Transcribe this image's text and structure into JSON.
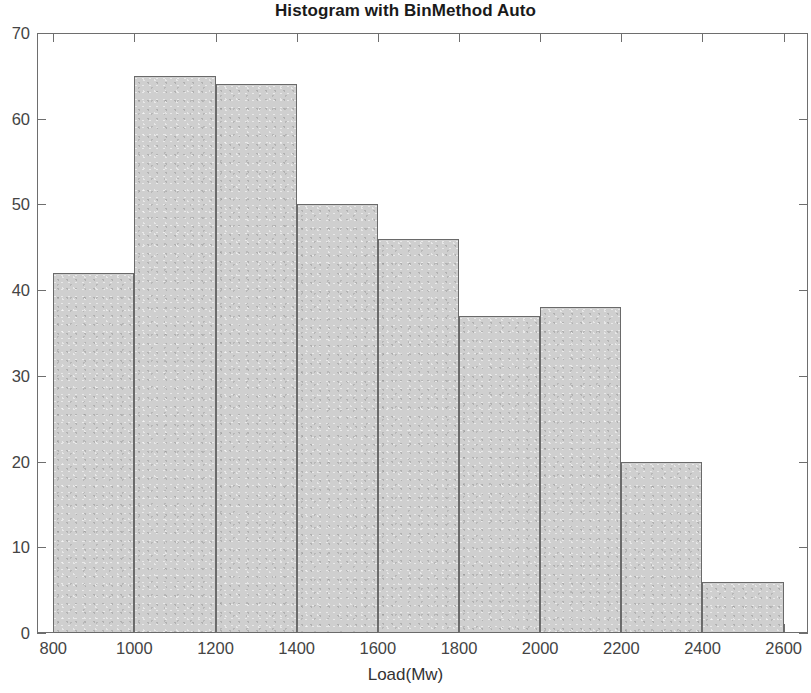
{
  "chart_data": {
    "type": "bar",
    "title": "Histogram with BinMethod Auto",
    "xlabel": "Load(Mw)",
    "ylabel": "",
    "bin_edges": [
      800,
      1000,
      1200,
      1400,
      1600,
      1800,
      2000,
      2200,
      2400,
      2600
    ],
    "categories": [
      "800-1000",
      "1000-1200",
      "1200-1400",
      "1400-1600",
      "1600-1800",
      "1800-2000",
      "2000-2200",
      "2200-2400",
      "2400-2600"
    ],
    "values": [
      42,
      65,
      64,
      50,
      46,
      37,
      38,
      20,
      6
    ],
    "bin_width": 200,
    "xlim": [
      760,
      2660
    ],
    "ylim": [
      0,
      70
    ],
    "xticks": [
      800,
      1000,
      1200,
      1400,
      1600,
      1800,
      2000,
      2200,
      2400,
      2600
    ],
    "yticks": [
      0,
      10,
      20,
      30,
      40,
      50,
      60,
      70
    ],
    "xtick_labels": [
      "800",
      "1000",
      "1200",
      "1400",
      "1600",
      "1800",
      "2000",
      "2200",
      "2400",
      "2600"
    ],
    "ytick_labels": [
      "0",
      "10",
      "20",
      "30",
      "40",
      "50",
      "60",
      "70"
    ],
    "grid": false,
    "legend": null,
    "bar_fill_color": "#cfcfcf",
    "bar_edge_color": "#6a6a6a",
    "axis_color": "#6e6e6e",
    "text_color": "#444444"
  }
}
